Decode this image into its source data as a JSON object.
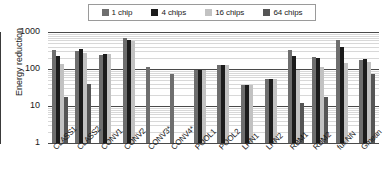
{
  "chart_data": {
    "type": "bar",
    "title": "",
    "xlabel": "",
    "ylabel": "Energy reduction",
    "yscale": "log",
    "ylim": [
      1,
      1000
    ],
    "ytick_labels": [
      "1000",
      "100",
      "10",
      "1"
    ],
    "grid": true,
    "legend_position": "top",
    "categories": [
      "CLASS1",
      "CLASS2",
      "CONV1",
      "CONV2",
      "CONV3*",
      "CONV4*",
      "POOL1",
      "POOL2",
      "LRN1",
      "LRN2",
      "RBM1",
      "RBM2",
      "full NN",
      "Gmean"
    ],
    "series": [
      {
        "name": "1 chip",
        "color": "#6e6e6e",
        "values": [
          330,
          300,
          245,
          680,
          115,
          72,
          95,
          125,
          36,
          55,
          330,
          215,
          620,
          170
        ]
      },
      {
        "name": "4 chips",
        "color": "#1c1c1c",
        "values": [
          220,
          350,
          260,
          600,
          null,
          null,
          93,
          125,
          36,
          55,
          220,
          200,
          390,
          185
        ]
      },
      {
        "name": "16 chips",
        "color": "#c2c2c2",
        "values": [
          135,
          270,
          258,
          575,
          null,
          null,
          95,
          125,
          36,
          55,
          95,
          110,
          150,
          155
        ]
      },
      {
        "name": "64 chips",
        "color": "#555555",
        "values": [
          17,
          40,
          null,
          null,
          null,
          null,
          null,
          null,
          null,
          null,
          12,
          18,
          null,
          72
        ]
      }
    ]
  },
  "legend": {
    "items": [
      {
        "label": "1 chip",
        "swatch": "#6e6e6e"
      },
      {
        "label": "4 chips",
        "swatch": "#1c1c1c"
      },
      {
        "label": "16 chips",
        "swatch": "#c2c2c2"
      },
      {
        "label": "64 chips",
        "swatch": "#555555"
      }
    ]
  }
}
